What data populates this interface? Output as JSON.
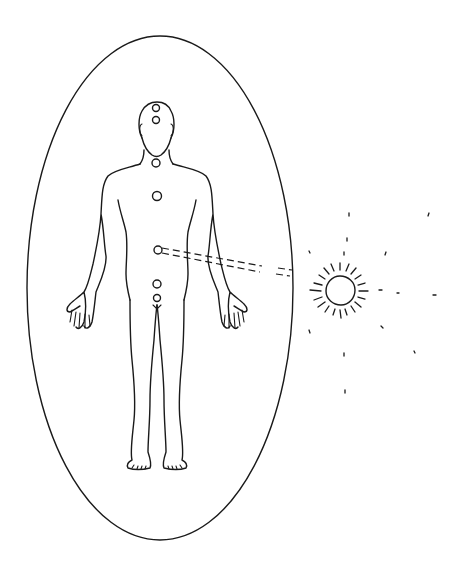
{
  "diagram": {
    "title": "",
    "colors": {
      "line": "#1a1a1a",
      "background": "#ffffff"
    },
    "aura": {
      "shape": "ellipse",
      "cx": 160,
      "cy": 288,
      "rx": 133,
      "ry": 252
    },
    "chakras": [
      {
        "name": "crown",
        "cx": 156,
        "cy": 108,
        "r": 3.5
      },
      {
        "name": "third-eye",
        "cx": 156,
        "cy": 120,
        "r": 3.5
      },
      {
        "name": "throat",
        "cx": 156,
        "cy": 163,
        "r": 4
      },
      {
        "name": "heart",
        "cx": 157,
        "cy": 196,
        "r": 4.5
      },
      {
        "name": "solar-plexus",
        "cx": 158,
        "cy": 250,
        "r": 4
      },
      {
        "name": "sacral",
        "cx": 157,
        "cy": 284,
        "r": 4
      },
      {
        "name": "root",
        "cx": 157,
        "cy": 298,
        "r": 3.5
      }
    ],
    "connection": {
      "from": "solar-plexus",
      "to": "sun",
      "style": "dashed-double-line"
    },
    "sun": {
      "cx": 340,
      "cy": 290,
      "r": 15
    }
  }
}
